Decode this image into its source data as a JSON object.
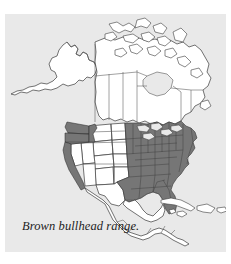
{
  "figure": {
    "caption": "Brown bullhead range.",
    "subject": "Brown bullhead",
    "map_region": "North America",
    "panel_background_color": "#e9e9e9",
    "page_background_color": "#ffffff",
    "land_fill_color": "#ffffff",
    "range_fill_color": "#767676",
    "outline_color": "#3a3a3a"
  },
  "legend": {
    "range_label": "Brown bullhead range",
    "range_swatch_color": "#767676",
    "outside_range_label": "Outside range",
    "outside_range_swatch_color": "#ffffff"
  },
  "map": {
    "projection_note": "North America including Alaska, Canada, the contiguous United States, Mexico, Central America and the Caribbean",
    "shaded_regions": [
      "Washington",
      "Oregon",
      "Idaho",
      "coastal California",
      "eastern North Dakota",
      "eastern South Dakota",
      "eastern Nebraska",
      "eastern Kansas",
      "eastern Oklahoma",
      "eastern Texas",
      "Minnesota",
      "Iowa",
      "Missouri",
      "Arkansas",
      "Louisiana",
      "Wisconsin",
      "Illinois",
      "Michigan",
      "Indiana",
      "Ohio",
      "Kentucky",
      "Tennessee",
      "Mississippi",
      "Alabama",
      "Georgia",
      "Florida",
      "South Carolina",
      "North Carolina",
      "Virginia",
      "West Virginia",
      "Pennsylvania",
      "New York",
      "New Jersey",
      "Delaware",
      "Maryland",
      "Connecticut",
      "Rhode Island",
      "Massachusetts",
      "Vermont",
      "New Hampshire",
      "Maine"
    ],
    "unshaded_regions": [
      "Alaska",
      "Canada",
      "Montana",
      "Wyoming",
      "Utah",
      "Nevada",
      "Arizona",
      "New Mexico",
      "Colorado",
      "western Texas",
      "Mexico",
      "Central America",
      "Cuba",
      "Hispaniola",
      "Jamaica",
      "Puerto Rico"
    ]
  }
}
